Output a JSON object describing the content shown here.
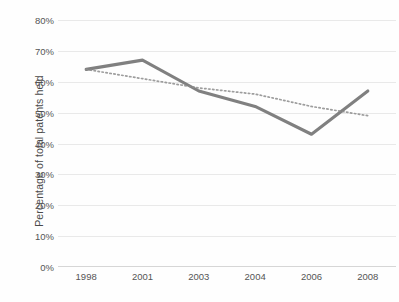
{
  "chart_data": {
    "type": "line",
    "title": "",
    "subtitle": "",
    "xlabel": "",
    "ylabel": "Percentage of total patents held",
    "categories": [
      "1998",
      "2001",
      "2003",
      "2004",
      "2006",
      "2008"
    ],
    "ytick_labels": [
      "0%",
      "10%",
      "20%",
      "30%",
      "40%",
      "50%",
      "60%",
      "70%",
      "80%"
    ],
    "ytick_values": [
      0,
      10,
      20,
      30,
      40,
      50,
      60,
      70,
      80
    ],
    "ylim": [
      0,
      80
    ],
    "grid": "horizontal",
    "legend": "none",
    "series": [
      {
        "name": "Percentage of total patents held",
        "style": "solid",
        "color": "#808080",
        "values": [
          64,
          67,
          57,
          52,
          43,
          57
        ]
      },
      {
        "name": "Linear trendline",
        "style": "dotted",
        "color": "#8c8c8c",
        "values": [
          64,
          61,
          58,
          56,
          52,
          49
        ]
      }
    ],
    "annotations": []
  }
}
